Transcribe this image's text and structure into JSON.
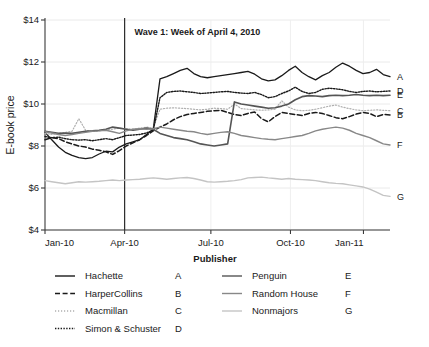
{
  "chart_data": {
    "type": "line",
    "title": "",
    "xlabel": "",
    "ylabel": "E-book price",
    "ylim": [
      4,
      14
    ],
    "yticks": [
      "$4",
      "$6",
      "$8",
      "$10",
      "$12",
      "$14"
    ],
    "ytick_values": [
      4,
      6,
      8,
      10,
      12,
      14
    ],
    "xticks": [
      "Jan-10",
      "Apr-10",
      "Jul-10",
      "Oct-10",
      "Jan-11"
    ],
    "xtick_values": [
      0,
      12,
      25,
      37,
      48
    ],
    "xlim": [
      0,
      52
    ],
    "grid": "horizontal-light",
    "legend_position": "bottom",
    "legend_title": "Publisher",
    "annotations": [
      {
        "text": "Wave 1: Week of April 4, 2010",
        "x": 13.5,
        "y": 13.3,
        "vline_x": 12
      }
    ],
    "end_labels": [
      "A",
      "D",
      "E",
      "C",
      "B",
      "F",
      "G"
    ],
    "series": [
      {
        "name": "Hachette",
        "key": "A",
        "style": "solid",
        "color": "#1a1a1a",
        "width": 1.3,
        "end_label": "A",
        "values": [
          8.65,
          8.3,
          7.95,
          7.7,
          7.55,
          7.45,
          7.4,
          7.45,
          7.62,
          7.75,
          7.72,
          7.95,
          8.1,
          8.2,
          8.3,
          8.55,
          8.8,
          11.2,
          11.3,
          11.45,
          11.6,
          11.7,
          11.45,
          11.3,
          11.25,
          11.3,
          11.35,
          11.4,
          11.45,
          11.5,
          11.55,
          11.42,
          11.2,
          11.1,
          11.15,
          11.35,
          11.6,
          11.8,
          11.5,
          11.3,
          11.15,
          11.35,
          11.5,
          11.75,
          11.95,
          11.8,
          11.6,
          11.45,
          11.5,
          11.65,
          11.4,
          11.3
        ]
      },
      {
        "name": "HarperCollins",
        "key": "B",
        "style": "dashed",
        "color": "#1a1a1a",
        "width": 1.5,
        "end_label": "B",
        "values": [
          8.3,
          8.4,
          8.35,
          8.2,
          8.1,
          8.0,
          7.95,
          7.85,
          7.8,
          7.72,
          7.6,
          7.78,
          8.0,
          8.15,
          8.3,
          8.5,
          8.72,
          8.9,
          9.05,
          9.25,
          9.4,
          9.5,
          9.55,
          9.6,
          9.65,
          9.68,
          9.7,
          9.6,
          9.5,
          9.45,
          9.55,
          9.62,
          9.3,
          9.15,
          9.4,
          9.6,
          9.55,
          9.5,
          9.45,
          9.55,
          9.6,
          9.55,
          9.45,
          9.35,
          9.3,
          9.4,
          9.52,
          9.6,
          9.55,
          9.4,
          9.5,
          9.48
        ]
      },
      {
        "name": "Macmillan",
        "key": "C",
        "style": "dotted-light",
        "color": "#b0b0b0",
        "width": 1.2,
        "end_label": "C",
        "values": [
          8.6,
          8.55,
          8.6,
          8.65,
          8.7,
          9.3,
          8.75,
          8.7,
          8.72,
          8.78,
          8.8,
          8.85,
          8.82,
          8.8,
          8.85,
          8.9,
          8.85,
          9.75,
          9.8,
          9.82,
          9.8,
          9.78,
          9.75,
          9.72,
          9.75,
          9.8,
          9.78,
          9.75,
          10.0,
          9.78,
          9.75,
          9.72,
          9.7,
          9.72,
          9.75,
          10.15,
          9.85,
          9.72,
          9.68,
          9.7,
          9.75,
          9.82,
          9.9,
          9.95,
          9.85,
          9.78,
          9.72,
          9.68,
          9.7,
          9.72,
          9.7,
          9.68
        ]
      },
      {
        "name": "Simon & Schuster",
        "key": "D",
        "style": "dotted",
        "color": "#1a1a1a",
        "width": 1.4,
        "end_label": "D",
        "values": [
          8.45,
          8.4,
          8.42,
          8.35,
          8.3,
          8.28,
          8.3,
          8.25,
          8.3,
          8.35,
          8.3,
          8.4,
          8.5,
          8.52,
          8.55,
          8.62,
          8.75,
          10.3,
          10.55,
          10.6,
          10.62,
          10.58,
          10.55,
          10.5,
          10.52,
          10.55,
          10.58,
          10.6,
          10.55,
          10.52,
          10.5,
          10.55,
          10.45,
          10.3,
          10.35,
          10.5,
          10.62,
          10.8,
          10.6,
          10.5,
          10.55,
          10.7,
          10.75,
          10.72,
          10.68,
          10.6,
          10.55,
          10.6,
          10.62,
          10.58,
          10.6,
          10.62
        ]
      },
      {
        "name": "Penguin",
        "key": "E",
        "style": "solid",
        "color": "#555555",
        "width": 1.6,
        "end_label": "E",
        "values": [
          8.7,
          8.65,
          8.6,
          8.62,
          8.6,
          8.65,
          8.7,
          8.72,
          8.75,
          8.8,
          8.9,
          8.85,
          8.8,
          8.75,
          8.8,
          8.85,
          8.8,
          8.6,
          8.5,
          8.4,
          8.35,
          8.3,
          8.2,
          8.1,
          8.05,
          8.0,
          8.05,
          8.1,
          10.1,
          10.0,
          9.95,
          9.9,
          9.85,
          9.8,
          9.82,
          9.9,
          10.0,
          10.2,
          10.35,
          10.4,
          10.38,
          10.35,
          10.4,
          10.42,
          10.4,
          10.42,
          10.45,
          10.42,
          10.4,
          10.42,
          10.4,
          10.42
        ]
      },
      {
        "name": "Random House",
        "key": "F",
        "style": "solid",
        "color": "#888888",
        "width": 1.4,
        "end_label": "F",
        "values": [
          8.68,
          8.62,
          8.55,
          8.5,
          8.55,
          8.6,
          8.65,
          8.7,
          8.72,
          8.75,
          8.68,
          8.6,
          8.72,
          8.8,
          8.82,
          8.8,
          8.82,
          8.9,
          8.85,
          8.8,
          8.75,
          8.7,
          8.68,
          8.6,
          8.55,
          8.6,
          8.65,
          8.68,
          8.6,
          8.5,
          8.45,
          8.4,
          8.35,
          8.32,
          8.3,
          8.35,
          8.4,
          8.45,
          8.5,
          8.6,
          8.72,
          8.8,
          8.85,
          8.9,
          8.85,
          8.75,
          8.6,
          8.5,
          8.4,
          8.25,
          8.1,
          8.05
        ]
      },
      {
        "name": "Nonmajors",
        "key": "G",
        "style": "solid",
        "color": "#c4c4c4",
        "width": 1.4,
        "end_label": "G",
        "values": [
          6.35,
          6.3,
          6.25,
          6.2,
          6.25,
          6.3,
          6.28,
          6.3,
          6.32,
          6.35,
          6.38,
          6.35,
          6.38,
          6.4,
          6.42,
          6.45,
          6.48,
          6.45,
          6.42,
          6.45,
          6.48,
          6.5,
          6.45,
          6.38,
          6.3,
          6.28,
          6.3,
          6.32,
          6.35,
          6.4,
          6.48,
          6.5,
          6.52,
          6.48,
          6.45,
          6.42,
          6.45,
          6.42,
          6.4,
          6.38,
          6.35,
          6.3,
          6.25,
          6.22,
          6.2,
          6.15,
          6.1,
          6.05,
          5.95,
          5.8,
          5.65,
          5.6
        ]
      }
    ],
    "legend_entries": [
      {
        "label": "Hachette",
        "key": "A",
        "style": "solid",
        "color": "#1a1a1a",
        "column": 1
      },
      {
        "label": "HarperCollins",
        "key": "B",
        "style": "dashed",
        "color": "#1a1a1a",
        "column": 1
      },
      {
        "label": "Macmillan",
        "key": "C",
        "style": "dotted-light",
        "color": "#b0b0b0",
        "column": 1
      },
      {
        "label": "Simon & Schuster",
        "key": "D",
        "style": "dotted",
        "color": "#1a1a1a",
        "column": 1
      },
      {
        "label": "Penguin",
        "key": "E",
        "style": "solid",
        "color": "#555555",
        "column": 2
      },
      {
        "label": "Random House",
        "key": "F",
        "style": "solid",
        "color": "#888888",
        "column": 2
      },
      {
        "label": "Nonmajors",
        "key": "G",
        "style": "solid",
        "color": "#c4c4c4",
        "column": 2
      }
    ]
  },
  "axis": {
    "y_title": "E-book price"
  }
}
